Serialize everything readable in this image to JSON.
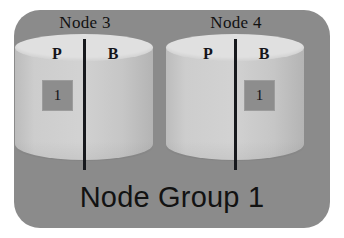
{
  "diagram": {
    "group_label": "Node Group 1",
    "background_color": "#ffffff",
    "group_box_color": "#8b8b8b",
    "cylinder_body_color": "#cdcdcd",
    "cylinder_top_color": "#e0e0e0",
    "divider_color": "#16181c",
    "fragment_color": "#8d8d8d",
    "text_color": "#121212",
    "nodes": [
      {
        "caption": "Node 3",
        "partitions": [
          {
            "label": "P",
            "name": "primary",
            "fragment": "1",
            "has_fragment": true
          },
          {
            "label": "B",
            "name": "backup",
            "fragment": "",
            "has_fragment": false
          }
        ]
      },
      {
        "caption": "Node 4",
        "partitions": [
          {
            "label": "P",
            "name": "primary",
            "fragment": "",
            "has_fragment": false
          },
          {
            "label": "B",
            "name": "backup",
            "fragment": "1",
            "has_fragment": true
          }
        ]
      }
    ]
  }
}
